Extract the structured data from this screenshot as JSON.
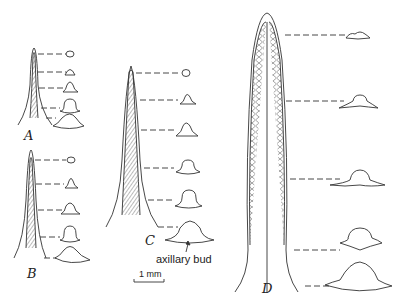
{
  "figure": {
    "panels": [
      {
        "id": "A",
        "label": "A"
      },
      {
        "id": "B",
        "label": "B"
      },
      {
        "id": "C",
        "label": "C"
      },
      {
        "id": "D",
        "label": "D"
      }
    ],
    "annotation": "axillary bud",
    "scale_bar": "1 mm",
    "colors": {
      "ink": "#333333",
      "background": "#ffffff"
    }
  }
}
